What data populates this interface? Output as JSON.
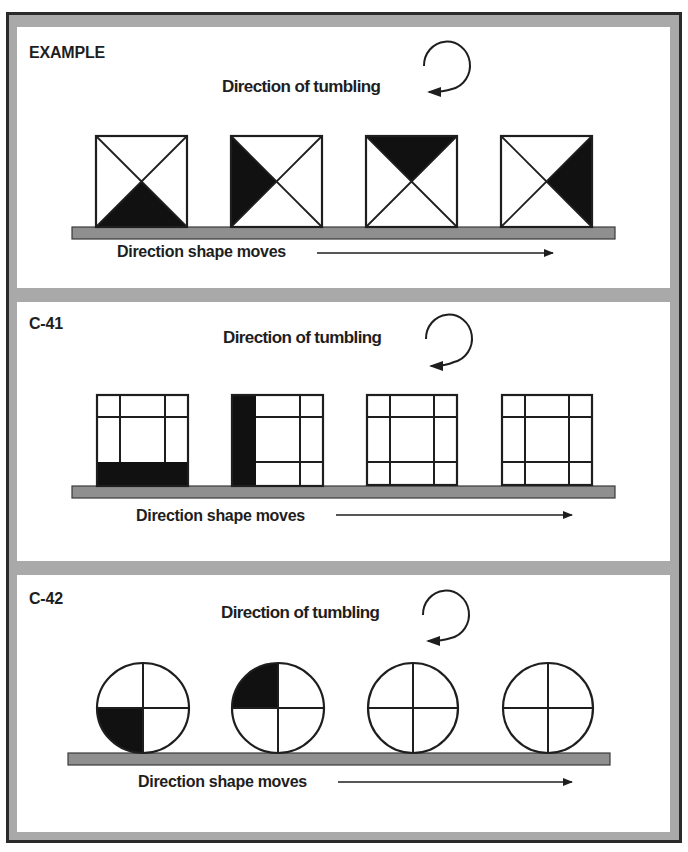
{
  "colors": {
    "frame_gray": "#a9a9a9",
    "frame_dark": "#2a2a2a",
    "ground_fill": "#8f8f8f",
    "ground_stroke": "#3a3a3a",
    "ink": "#1e1e1e",
    "shape_fill": "#111111"
  },
  "panels": [
    {
      "label": "EXAMPLE",
      "tumbling_label": "Direction of tumbling",
      "moves_label": "Direction shape moves",
      "tumbling_direction": "clockwise",
      "shape_type": "square-x",
      "shapes": [
        {
          "filled": "bottom"
        },
        {
          "filled": "left"
        },
        {
          "filled": "top"
        },
        {
          "filled": "right"
        }
      ]
    },
    {
      "label": "C-41",
      "tumbling_label": "Direction of tumbling",
      "moves_label": "Direction shape moves",
      "tumbling_direction": "clockwise",
      "shape_type": "square-grid-3x3",
      "shapes": [
        {
          "filled": "bottom-strip"
        },
        {
          "filled": "left-strip"
        },
        {
          "filled": "none"
        },
        {
          "filled": "none"
        }
      ]
    },
    {
      "label": "C-42",
      "tumbling_label": "Direction of tumbling",
      "moves_label": "Direction shape moves",
      "tumbling_direction": "clockwise",
      "shape_type": "circle-quadrants",
      "shapes": [
        {
          "filled": "bottom-left"
        },
        {
          "filled": "top-left"
        },
        {
          "filled": "none"
        },
        {
          "filled": "none"
        }
      ]
    }
  ]
}
